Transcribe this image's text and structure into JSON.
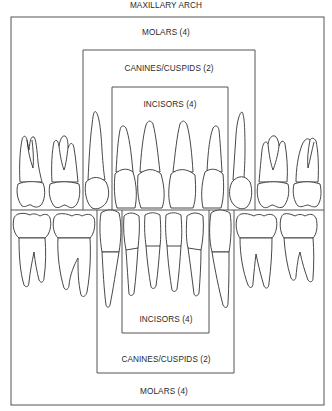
{
  "title": "MAXILLARY ARCH",
  "upper": {
    "molars_label": "MOLARS (4)",
    "canines_label": "CANINES/CUSPIDS (2)",
    "incisors_label": "INCISORS (4)"
  },
  "lower": {
    "incisors_label": "INCISORS (4)",
    "canines_label": "CANINES/CUSPIDS (2)",
    "molars_label": "MOLARS (4)"
  },
  "colors": {
    "line": "#333333",
    "box": "#555555",
    "text": "#2a2a2a",
    "background": "#ffffff"
  }
}
